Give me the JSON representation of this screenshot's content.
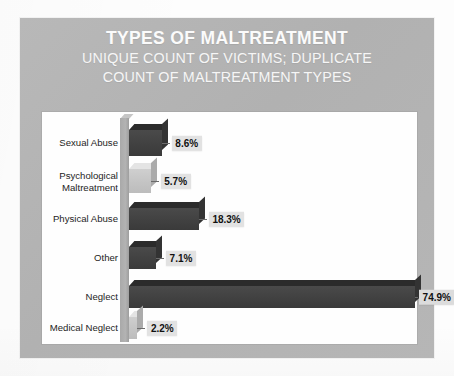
{
  "chart_data": {
    "type": "bar",
    "orientation": "horizontal",
    "title": "TYPES OF MALTREATMENT",
    "subtitle_line1": "UNIQUE COUNT OF VICTIMS; DUPLICATE",
    "subtitle_line2": "COUNT OF MALTREATMENT TYPES",
    "xlabel": "",
    "ylabel": "",
    "grid": false,
    "legend": "none",
    "value_suffix": "%",
    "xlim": [
      0,
      80
    ],
    "categories": [
      "Sexual Abuse",
      "Psychological Maltreatment",
      "Physical Abuse",
      "Other",
      "Neglect",
      "Medical Neglect"
    ],
    "values": [
      8.6,
      5.7,
      18.3,
      7.1,
      74.9,
      2.2
    ],
    "value_labels": [
      "8.6%",
      "5.7%",
      "18.3%",
      "7.1%",
      "74.9%",
      "2.2%"
    ],
    "bars": [
      {
        "category_line1": "Sexual Abuse",
        "category_line2": "",
        "value": 8.6,
        "label": "8.6%",
        "shade": "dark"
      },
      {
        "category_line1": "Psychological",
        "category_line2": "Maltreatment",
        "value": 5.7,
        "label": "5.7%",
        "shade": "light"
      },
      {
        "category_line1": "Physical Abuse",
        "category_line2": "",
        "value": 18.3,
        "label": "18.3%",
        "shade": "dark"
      },
      {
        "category_line1": "Other",
        "category_line2": "",
        "value": 7.1,
        "label": "7.1%",
        "shade": "dark"
      },
      {
        "category_line1": "Neglect",
        "category_line2": "",
        "value": 74.9,
        "label": "74.9%",
        "shade": "dark"
      },
      {
        "category_line1": "Medical Neglect",
        "category_line2": "",
        "value": 2.2,
        "label": "2.2%",
        "shade": "light"
      }
    ]
  },
  "colors": {
    "card_background": "#b4b4b4",
    "plot_background": "#fefefe",
    "bar_dark": "#414141",
    "bar_light": "#c4c4c4",
    "title_text": "#fbfbfb",
    "label_text": "#1d1d1d",
    "value_box": "#e2e2e2"
  },
  "caption": ""
}
